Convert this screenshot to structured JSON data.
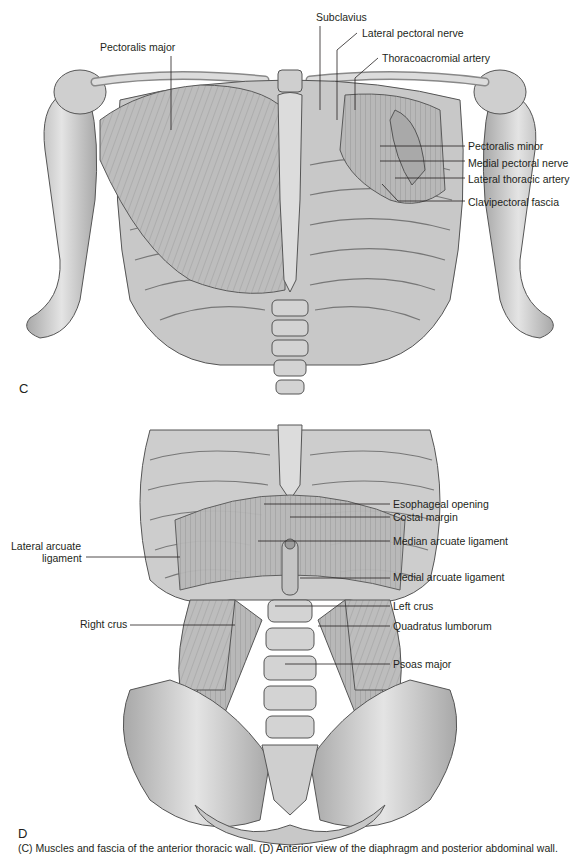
{
  "figure": {
    "panels": [
      {
        "letter": "C",
        "title": "Anterior thoracic wall — pectoral region",
        "labels": [
          {
            "id": "pectoralis-major",
            "text": "Pectoralis major",
            "x": 100,
            "y": 41,
            "align": "left"
          },
          {
            "id": "subclavius",
            "text": "Subclavius",
            "x": 316,
            "y": 11,
            "align": "left"
          },
          {
            "id": "lateral-pectoral-nerve",
            "text": "Lateral pectoral nerve",
            "x": 362,
            "y": 27,
            "align": "left"
          },
          {
            "id": "thoracoacromial-artery",
            "text": "Thoracoacromial artery",
            "x": 382,
            "y": 52,
            "align": "left"
          },
          {
            "id": "pectoralis-minor",
            "text": "Pectoralis minor",
            "x": 468,
            "y": 140,
            "align": "left"
          },
          {
            "id": "medial-pectoral-nerve",
            "text": "Medial pectoral nerve",
            "x": 468,
            "y": 157,
            "align": "left"
          },
          {
            "id": "lateral-thoracic-artery",
            "text": "Lateral thoracic artery",
            "x": 468,
            "y": 173,
            "align": "left"
          },
          {
            "id": "clavipectoral-fascia",
            "text": "Clavipectoral fascia",
            "x": 468,
            "y": 196,
            "align": "left"
          }
        ],
        "leaders": [
          {
            "id": "pectoralis-major",
            "points": [
              [
                171,
                56
              ],
              [
                171,
                130
              ]
            ]
          },
          {
            "id": "subclavius",
            "points": [
              [
                320,
                26
              ],
              [
                320,
                110
              ]
            ]
          },
          {
            "id": "lateral-pectoral-nerve",
            "points": [
              [
                357,
                33
              ],
              [
                337,
                50
              ],
              [
                337,
                120
              ]
            ]
          },
          {
            "id": "thoracoacromial-artery",
            "points": [
              [
                378,
                58
              ],
              [
                355,
                78
              ],
              [
                355,
                110
              ]
            ]
          },
          {
            "id": "pectoralis-minor",
            "points": [
              [
                380,
                146
              ],
              [
                465,
                146
              ]
            ]
          },
          {
            "id": "medial-pectoral-nerve",
            "points": [
              [
                380,
                161
              ],
              [
                465,
                161
              ]
            ]
          },
          {
            "id": "lateral-thoracic-artery",
            "points": [
              [
                395,
                178
              ],
              [
                465,
                178
              ]
            ]
          },
          {
            "id": "clavipectoral-fascia",
            "points": [
              [
                382,
                184
              ],
              [
                398,
                201
              ],
              [
                465,
                201
              ]
            ]
          }
        ]
      },
      {
        "letter": "D",
        "title": "Diaphragm — posterior abdominal wall",
        "labels": [
          {
            "id": "esophageal-opening",
            "text": "Esophageal opening",
            "x": 393,
            "y": 498,
            "align": "left"
          },
          {
            "id": "costal-margin",
            "text": "Costal margin",
            "x": 393,
            "y": 511,
            "align": "left"
          },
          {
            "id": "median-arcuate-ligament",
            "text": "Median arcuate ligament",
            "x": 393,
            "y": 535,
            "align": "left"
          },
          {
            "id": "medial-arcuate-ligament",
            "text": "Medial arcuate ligament",
            "x": 393,
            "y": 571,
            "align": "left"
          },
          {
            "id": "left-crus",
            "text": "Left crus",
            "x": 393,
            "y": 600,
            "align": "left"
          },
          {
            "id": "quadratus-lumborum",
            "text": "Quadratus lumborum",
            "x": 393,
            "y": 620,
            "align": "left"
          },
          {
            "id": "psoas-major",
            "text": "Psoas major",
            "x": 393,
            "y": 658,
            "align": "left"
          },
          {
            "id": "lateral-arcuate-ligament-line1",
            "text": "Lateral arcuate",
            "x": 11,
            "y": 540,
            "align": "left"
          },
          {
            "id": "lateral-arcuate-ligament-line2",
            "text": "ligament",
            "x": 42,
            "y": 552,
            "align": "left"
          },
          {
            "id": "right-crus",
            "text": "Right crus",
            "x": 80,
            "y": 618,
            "align": "left"
          }
        ],
        "leaders": [
          {
            "id": "esophageal-opening",
            "points": [
              [
                264,
                504
              ],
              [
                390,
                504
              ]
            ]
          },
          {
            "id": "costal-margin",
            "points": [
              [
                290,
                517
              ],
              [
                390,
                517
              ]
            ]
          },
          {
            "id": "median-arcuate-ligament",
            "points": [
              [
                258,
                541
              ],
              [
                390,
                541
              ]
            ]
          },
          {
            "id": "medial-arcuate-ligament",
            "points": [
              [
                300,
                578
              ],
              [
                390,
                578
              ]
            ]
          },
          {
            "id": "left-crus",
            "points": [
              [
                275,
                606
              ],
              [
                390,
                606
              ]
            ]
          },
          {
            "id": "quadratus-lumborum",
            "points": [
              [
                318,
                626
              ],
              [
                390,
                626
              ]
            ]
          },
          {
            "id": "psoas-major",
            "points": [
              [
                285,
                664
              ],
              [
                390,
                664
              ]
            ]
          },
          {
            "id": "lateral-arcuate-ligament",
            "points": [
              [
                86,
                557
              ],
              [
                180,
                557
              ]
            ]
          },
          {
            "id": "right-crus",
            "points": [
              [
                130,
                625
              ],
              [
                235,
                625
              ]
            ]
          }
        ]
      }
    ],
    "caption": {
      "text": "(C) Muscles and fascia of the anterior thoracic wall. (D) Anterior view of the diaphragm and posterior abdominal wall.",
      "visible": "partial (cut off at bottom edge)"
    }
  },
  "colors": {
    "bone": "#d9d9d9",
    "bone_shade": "#9a9a9a",
    "muscle": "#bdbdbd",
    "muscle_dark": "#8c8c8c",
    "outline": "#4d4d4d",
    "label_text": "#231f20",
    "leader_line": "#231f20"
  }
}
